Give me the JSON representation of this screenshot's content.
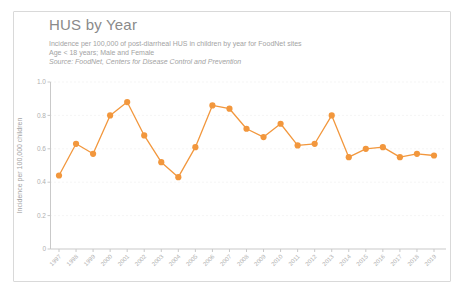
{
  "card": {
    "title": "HUS by Year",
    "subtitle1": "Incidence per 100,000 of post-diarrheal HUS in children by year for FoodNet sites",
    "subtitle2": "Age < 18 years; Male and Female",
    "subtitle3": "Source: FoodNet, Centers for Disease Control and Prevention"
  },
  "chart_data": {
    "type": "line",
    "title": "HUS by Year",
    "categories": [
      "1997",
      "1998",
      "1999",
      "2000",
      "2001",
      "2002",
      "2003",
      "2004",
      "2005",
      "2006",
      "2007",
      "2008",
      "2009",
      "2010",
      "2011",
      "2012",
      "2013",
      "2014",
      "2015",
      "2016",
      "2017",
      "2018",
      "2019"
    ],
    "series": [
      {
        "name": "HUS incidence per 100,000 children",
        "values": [
          0.44,
          0.63,
          0.57,
          0.8,
          0.88,
          0.68,
          0.52,
          0.43,
          0.61,
          0.86,
          0.84,
          0.72,
          0.67,
          0.75,
          0.62,
          0.63,
          0.8,
          0.55,
          0.6,
          0.61,
          0.55,
          0.57,
          0.56
        ]
      }
    ],
    "xlabel": "",
    "ylabel": "Incidence per 100,000 children",
    "ylim": [
      0,
      1.0
    ],
    "yticks": [
      0,
      0.2,
      0.4,
      0.6,
      0.8,
      1.0
    ],
    "ytick_labels": [
      "0",
      "0.2",
      "0.4",
      "0.6",
      "0.8",
      "1.0"
    ],
    "grid": "faint-dotted-horizontal",
    "legend_position": "none",
    "line_color": "#F2973D",
    "marker": "circle",
    "axis_color": "#c9c9c9",
    "tick_label_color": "#b0b0b0",
    "axis_title_color": "#a3a3a3",
    "grid_color": "#ebebeb"
  }
}
